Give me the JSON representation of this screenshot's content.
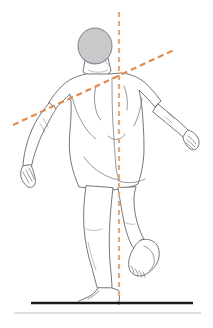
{
  "illustration": {
    "title": "Posture Assessment — Single Leg Stance, Posterior View",
    "subject_view": "posterior",
    "subject_pose": "single-leg-stance-right-leg-lifted",
    "head": {
      "label": "head",
      "fill_color": "#c9c9cc",
      "stroke_color": "#74747e",
      "center_x": 95,
      "center_y": 46,
      "radius_x": 17,
      "radius_y": 18
    },
    "body": {
      "label": "body-outline",
      "stroke_color": "#5c5c66",
      "fill_color": "#ffffff"
    },
    "plumb_line": {
      "label": "vertical-plumb-line",
      "color": "#e8a878",
      "x": 119,
      "y_start": 12,
      "y_end": 305,
      "dash": "5 4",
      "width": 2.2
    },
    "shoulder_line": {
      "label": "shoulder-tilt-line",
      "color": "#e08a50",
      "x_start": 13,
      "y_start": 125,
      "x_end": 176,
      "y_end": 49,
      "dash": "6 4",
      "width": 2.2
    },
    "ground": {
      "label": "ground-reference-line",
      "main_color": "#1a1a1a",
      "main_x_start": 31,
      "main_x_end": 193,
      "main_y": 303,
      "main_width": 2.6,
      "shadow_color": "#d5d5d5",
      "shadow_x_start": 14,
      "shadow_x_end": 201,
      "shadow_y": 313,
      "shadow_width": 1.6
    },
    "canvas": {
      "width": 213,
      "height": 328,
      "background": "#ffffff"
    }
  }
}
